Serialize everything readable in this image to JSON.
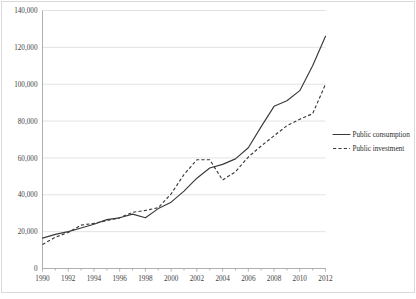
{
  "chart_data": {
    "type": "line",
    "title": "",
    "subtitle": "",
    "xlabel": "",
    "ylabel": "",
    "x": [
      1990,
      1991,
      1992,
      1993,
      1994,
      1995,
      1996,
      1997,
      1998,
      1999,
      2000,
      2001,
      2002,
      2003,
      2004,
      2005,
      2006,
      2007,
      2008,
      2009,
      2010,
      2011,
      2012
    ],
    "xlim": [
      1990,
      2012
    ],
    "ylim": [
      0,
      140000
    ],
    "ytick_values": [
      0,
      20000,
      40000,
      60000,
      80000,
      100000,
      120000,
      140000
    ],
    "ytick_labels": [
      "0",
      "20,000",
      "40,000",
      "60,000",
      "80,000",
      "100,000",
      "120,000",
      "140,000"
    ],
    "xtick_values": [
      1990,
      1992,
      1994,
      1996,
      1998,
      2000,
      2002,
      2004,
      2006,
      2008,
      2010,
      2012
    ],
    "xtick_labels": [
      "1990",
      "1992",
      "1994",
      "1996",
      "1998",
      "2000",
      "2002",
      "2004",
      "2006",
      "2008",
      "2010",
      "2012"
    ],
    "grid": "horizontal",
    "legend_position": "right",
    "series": [
      {
        "name": "Public consumption",
        "style": "solid",
        "color": "#3a3a3a",
        "values": [
          16500,
          18500,
          20000,
          22000,
          24000,
          26500,
          27500,
          29500,
          27500,
          32500,
          36000,
          42000,
          49000,
          54500,
          56500,
          59500,
          65500,
          77000,
          88000,
          91000,
          96500,
          110000,
          126000
        ]
      },
      {
        "name": "Public investment",
        "style": "dashed",
        "color": "#3a3a3a",
        "values": [
          13000,
          17000,
          19500,
          23500,
          24500,
          26000,
          27500,
          30500,
          31500,
          33000,
          40500,
          51000,
          59000,
          59000,
          48000,
          52500,
          60500,
          66500,
          72000,
          77500,
          81000,
          84000,
          100000
        ]
      }
    ]
  },
  "legend": {
    "items": [
      {
        "label": "Public consumption"
      },
      {
        "label": "Public investment"
      }
    ]
  }
}
